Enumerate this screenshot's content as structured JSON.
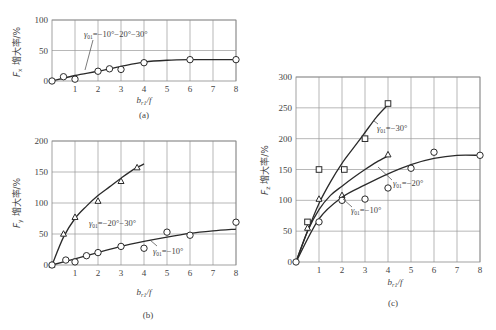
{
  "chart_data": [
    {
      "panel": "a",
      "type": "line",
      "caption": "(a)",
      "xlabel": "b_{r1}/f",
      "ylabel": "F_x 增大率/%",
      "xlim": [
        0,
        8
      ],
      "ylim": [
        0,
        100
      ],
      "xticks": [
        1,
        2,
        3,
        4,
        5,
        6,
        7,
        8
      ],
      "yticks": [
        0,
        50,
        100
      ],
      "grid": true,
      "series": [
        {
          "name": "γ01=−10°~20°~30°",
          "marker": "circle",
          "points": [
            [
              0,
              0
            ],
            [
              0.5,
              7
            ],
            [
              1,
              3
            ],
            [
              2,
              16
            ],
            [
              2.5,
              20
            ],
            [
              3,
              19
            ],
            [
              4,
              30
            ],
            [
              6,
              35
            ],
            [
              8,
              35
            ]
          ],
          "curve": [
            [
              0,
              0
            ],
            [
              1,
              9
            ],
            [
              2,
              16
            ],
            [
              3,
              24
            ],
            [
              4,
              31
            ],
            [
              5,
              34
            ],
            [
              6,
              35
            ],
            [
              7,
              35
            ],
            [
              8,
              35
            ]
          ]
        }
      ],
      "annotations": [
        {
          "text": "γ01=−10°−20°−30°"
        }
      ]
    },
    {
      "panel": "b",
      "type": "line",
      "caption": "(b)",
      "xlabel": "b_{r1}/f",
      "ylabel": "F_y 增大率/%",
      "xlim": [
        0,
        8
      ],
      "ylim": [
        0,
        200
      ],
      "xticks": [
        1,
        2,
        3,
        4,
        5,
        6,
        7,
        8
      ],
      "yticks": [
        0,
        50,
        100,
        150,
        200
      ],
      "grid": true,
      "series": [
        {
          "name": "γ01=−20°~−30°",
          "marker": "triangle",
          "points": [
            [
              0,
              0
            ],
            [
              0.5,
              50
            ],
            [
              1,
              77
            ],
            [
              2,
              103
            ],
            [
              3,
              135
            ],
            [
              3.7,
              157
            ]
          ],
          "curve": [
            [
              0,
              0
            ],
            [
              0.5,
              45
            ],
            [
              1,
              75
            ],
            [
              1.5,
              95
            ],
            [
              2,
              112
            ],
            [
              2.5,
              126
            ],
            [
              3,
              140
            ],
            [
              3.5,
              153
            ],
            [
              4,
              163
            ]
          ]
        },
        {
          "name": "γ01=−10°",
          "marker": "circle",
          "points": [
            [
              0,
              0
            ],
            [
              0.6,
              8
            ],
            [
              1,
              5
            ],
            [
              1.5,
              15
            ],
            [
              2,
              20
            ],
            [
              3,
              30
            ],
            [
              4,
              27
            ],
            [
              5,
              53
            ],
            [
              6,
              48
            ],
            [
              8,
              69
            ]
          ],
          "curve": [
            [
              0,
              0
            ],
            [
              1,
              10
            ],
            [
              2,
              20
            ],
            [
              3,
              30
            ],
            [
              4,
              38
            ],
            [
              5,
              45
            ],
            [
              6,
              51
            ],
            [
              7,
              55
            ],
            [
              8,
              58
            ]
          ]
        }
      ],
      "annotations": [
        {
          "text": "γ01=−20°−30°"
        },
        {
          "text": "γ01=−10°"
        }
      ]
    },
    {
      "panel": "c",
      "type": "line",
      "caption": "(c)",
      "xlabel": "b_{r1}/f",
      "ylabel": "F_z 增大率/%",
      "xlim": [
        0,
        8
      ],
      "ylim": [
        0,
        300
      ],
      "xticks": [
        1,
        2,
        3,
        4,
        5,
        6,
        7,
        8
      ],
      "yticks": [
        0,
        50,
        100,
        150,
        200,
        250,
        300
      ],
      "grid": true,
      "series": [
        {
          "name": "γ01=−30°",
          "marker": "square",
          "points": [
            [
              0.5,
              65
            ],
            [
              1,
              150
            ],
            [
              2.1,
              150
            ],
            [
              3,
              200
            ],
            [
              4,
              257
            ]
          ],
          "curve": [
            [
              0,
              0
            ],
            [
              0.5,
              50
            ],
            [
              1,
              95
            ],
            [
              1.5,
              130
            ],
            [
              2,
              160
            ],
            [
              2.5,
              185
            ],
            [
              3,
              210
            ],
            [
              3.5,
              235
            ],
            [
              4,
              255
            ]
          ]
        },
        {
          "name": "γ01=−20°",
          "marker": "triangle",
          "points": [
            [
              0.5,
              55
            ],
            [
              1,
              102
            ],
            [
              2,
              108
            ],
            [
              4,
              174
            ]
          ],
          "curve": [
            [
              0,
              0
            ],
            [
              0.5,
              50
            ],
            [
              1,
              85
            ],
            [
              1.5,
              108
            ],
            [
              2,
              123
            ],
            [
              2.5,
              137
            ],
            [
              3,
              150
            ],
            [
              3.5,
              162
            ],
            [
              4,
              172
            ]
          ]
        },
        {
          "name": "γ01=−10°",
          "marker": "circle",
          "points": [
            [
              0,
              0
            ],
            [
              1,
              65
            ],
            [
              2,
              100
            ],
            [
              3,
              102
            ],
            [
              4,
              120
            ],
            [
              5,
              152
            ],
            [
              6,
              178
            ],
            [
              8,
              173
            ]
          ],
          "curve": [
            [
              0,
              0
            ],
            [
              1,
              70
            ],
            [
              2,
              105
            ],
            [
              3,
              125
            ],
            [
              4,
              143
            ],
            [
              5,
              158
            ],
            [
              6,
              168
            ],
            [
              7,
              173
            ],
            [
              8,
              173
            ]
          ]
        }
      ],
      "annotations": [
        {
          "text": "γ01=−30°"
        },
        {
          "text": "γ01=−20°"
        },
        {
          "text": "γ01=−10°"
        }
      ]
    }
  ],
  "labels": {
    "a": {
      "caption": "(a)",
      "ylabel": "F",
      "ysub": "x",
      "ysuffix": " 增大率/%",
      "xlabel": "b",
      "xsub": "r1",
      "xsuffix": "/f",
      "ann1": "γ",
      "ann1sub": "01",
      "ann1rest": "=−10°−20°−30°"
    },
    "b": {
      "caption": "(b)",
      "ylabel": "F",
      "ysub": "y",
      "ysuffix": " 增大率/%",
      "xlabel": "b",
      "xsub": "r1",
      "xsuffix": "/f",
      "ann1": "γ",
      "ann1sub": "01",
      "ann1rest": "=−20°−30°",
      "ann2": "γ",
      "ann2sub": "01",
      "ann2rest": "=−10°"
    },
    "c": {
      "caption": "(c)",
      "ylabel": "F",
      "ysub": "z",
      "ysuffix": " 增大率/%",
      "xlabel": "b",
      "xsub": "r1",
      "xsuffix": "/f",
      "ann1": "γ",
      "ann1sub": "01",
      "ann1rest": "=−30°",
      "ann2": "γ",
      "ann2sub": "01",
      "ann2rest": "=−20°",
      "ann3": "γ",
      "ann3sub": "01",
      "ann3rest": "=−10°"
    }
  }
}
